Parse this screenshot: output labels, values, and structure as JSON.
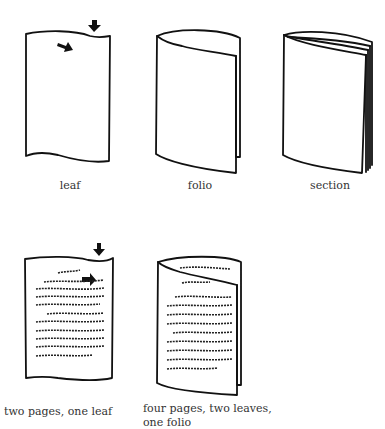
{
  "diagram": {
    "type": "book-structure-illustration",
    "figures": [
      {
        "id": "leaf",
        "caption": "leaf"
      },
      {
        "id": "folio",
        "caption": "folio"
      },
      {
        "id": "section",
        "caption": "section"
      },
      {
        "id": "two-pages-one-leaf",
        "caption": "two pages, one leaf"
      },
      {
        "id": "four-pages",
        "caption_line1": "four pages, two leaves,",
        "caption_line2": "one folio"
      }
    ]
  },
  "colors": {
    "ink": "#111111",
    "text": "#333333",
    "background": "#ffffff"
  }
}
